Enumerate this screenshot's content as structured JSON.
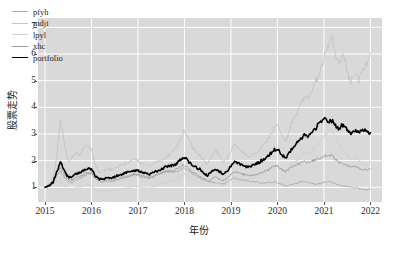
{
  "chart_data": {
    "type": "line",
    "title": "",
    "xlabel": "年份",
    "ylabel": "股票走势",
    "xlim": [
      2014.85,
      2022.25
    ],
    "ylim": [
      0.45,
      7.35
    ],
    "xticks": [
      "2015",
      "2016",
      "2017",
      "2018",
      "2019",
      "2020",
      "2021",
      "2022"
    ],
    "xtick_values": [
      2015,
      2016,
      2017,
      2018,
      2019,
      2020,
      2021,
      2022
    ],
    "yticks": [
      "1",
      "2",
      "3",
      "4",
      "5",
      "6",
      "7"
    ],
    "ytick_values": [
      1,
      2,
      3,
      4,
      5,
      6,
      7
    ],
    "grid": true,
    "grid_color": "#ffffff",
    "plot_bgcolor": "#d9d9d9",
    "figure_bgcolor": "#ffffff",
    "legend_position": "upper-left",
    "x": [
      2015.0,
      2015.08,
      2015.17,
      2015.25,
      2015.33,
      2015.42,
      2015.5,
      2015.58,
      2015.67,
      2015.75,
      2015.83,
      2015.92,
      2016.0,
      2016.08,
      2016.17,
      2016.25,
      2016.33,
      2016.42,
      2016.5,
      2016.58,
      2016.67,
      2016.75,
      2016.83,
      2016.92,
      2017.0,
      2017.08,
      2017.17,
      2017.25,
      2017.33,
      2017.42,
      2017.5,
      2017.58,
      2017.67,
      2017.75,
      2017.83,
      2017.92,
      2018.0,
      2018.08,
      2018.17,
      2018.25,
      2018.33,
      2018.42,
      2018.5,
      2018.58,
      2018.67,
      2018.75,
      2018.83,
      2018.92,
      2019.0,
      2019.08,
      2019.17,
      2019.25,
      2019.33,
      2019.42,
      2019.5,
      2019.58,
      2019.67,
      2019.75,
      2019.83,
      2019.92,
      2020.0,
      2020.08,
      2020.17,
      2020.25,
      2020.33,
      2020.42,
      2020.5,
      2020.58,
      2020.67,
      2020.75,
      2020.83,
      2020.92,
      2021.0,
      2021.08,
      2021.17,
      2021.25,
      2021.33,
      2021.42,
      2021.5,
      2021.58,
      2021.67,
      2021.75,
      2021.83,
      2021.92,
      2022.0
    ],
    "series": [
      {
        "name": "pfyh",
        "color": "#a8a8a8",
        "width": 0.9,
        "values": [
          1.0,
          1.05,
          1.12,
          1.45,
          1.62,
          1.38,
          1.2,
          1.18,
          1.3,
          1.35,
          1.42,
          1.5,
          1.55,
          1.4,
          1.3,
          1.28,
          1.32,
          1.3,
          1.33,
          1.36,
          1.4,
          1.42,
          1.45,
          1.5,
          1.48,
          1.45,
          1.42,
          1.4,
          1.44,
          1.5,
          1.55,
          1.6,
          1.58,
          1.55,
          1.6,
          1.68,
          1.72,
          1.65,
          1.5,
          1.42,
          1.35,
          1.28,
          1.22,
          1.2,
          1.18,
          1.15,
          1.12,
          1.18,
          1.3,
          1.35,
          1.32,
          1.28,
          1.25,
          1.22,
          1.2,
          1.18,
          1.16,
          1.15,
          1.18,
          1.2,
          1.18,
          1.12,
          1.05,
          1.08,
          1.12,
          1.15,
          1.2,
          1.22,
          1.18,
          1.15,
          1.12,
          1.15,
          1.2,
          1.22,
          1.18,
          1.12,
          1.08,
          1.05,
          1.02,
          1.0,
          0.98,
          0.95,
          0.92,
          0.9,
          0.92
        ]
      },
      {
        "name": "mdjt",
        "color": "#c4c4c4",
        "width": 0.9,
        "values": [
          1.0,
          1.1,
          1.35,
          2.1,
          3.55,
          2.6,
          1.95,
          2.1,
          2.35,
          2.2,
          2.45,
          2.6,
          2.4,
          1.85,
          1.55,
          1.6,
          1.72,
          1.65,
          1.7,
          1.78,
          1.85,
          1.9,
          1.95,
          2.05,
          2.0,
          1.92,
          1.85,
          1.8,
          1.88,
          1.95,
          2.0,
          2.1,
          2.2,
          2.35,
          2.5,
          2.8,
          3.15,
          2.85,
          2.5,
          2.35,
          2.2,
          2.0,
          1.85,
          2.15,
          2.45,
          2.2,
          1.95,
          2.1,
          2.35,
          2.6,
          2.45,
          2.3,
          2.2,
          2.15,
          2.25,
          2.35,
          2.5,
          2.65,
          2.9,
          3.2,
          3.35,
          3.0,
          2.7,
          3.1,
          3.5,
          3.8,
          4.1,
          4.4,
          4.3,
          4.6,
          5.0,
          5.4,
          5.8,
          6.2,
          6.7,
          5.9,
          5.5,
          6.0,
          5.4,
          4.9,
          5.3,
          5.0,
          5.45,
          5.7,
          6.05
        ]
      },
      {
        "name": "lpyl",
        "color": "#cfcfcf",
        "width": 0.9,
        "values": [
          1.0,
          1.02,
          1.08,
          1.25,
          1.18,
          1.05,
          0.95,
          0.92,
          0.98,
          1.02,
          1.05,
          1.1,
          1.08,
          0.95,
          0.85,
          0.82,
          0.85,
          0.88,
          0.9,
          0.92,
          0.95,
          0.98,
          1.0,
          1.05,
          1.02,
          1.0,
          0.98,
          0.96,
          1.0,
          1.05,
          1.1,
          1.15,
          1.2,
          1.25,
          1.3,
          1.4,
          1.5,
          1.42,
          1.3,
          1.25,
          1.2,
          1.12,
          1.05,
          1.08,
          1.15,
          1.1,
          1.05,
          1.15,
          1.3,
          1.38,
          1.35,
          1.3,
          1.28,
          1.3,
          1.35,
          1.42,
          1.5,
          1.58,
          1.68,
          1.8,
          1.85,
          1.7,
          1.6,
          1.75,
          1.9,
          2.0,
          2.15,
          2.3,
          2.25,
          2.4,
          2.55,
          2.7,
          2.9,
          3.05,
          3.2,
          2.85,
          2.6,
          2.4,
          2.2,
          2.05,
          2.15,
          2.0,
          1.9,
          1.82,
          1.95
        ]
      },
      {
        "name": "xhc",
        "color": "#9c9c9c",
        "width": 0.9,
        "values": [
          1.0,
          1.08,
          1.2,
          1.55,
          1.75,
          1.5,
          1.3,
          1.28,
          1.38,
          1.42,
          1.5,
          1.55,
          1.52,
          1.35,
          1.22,
          1.2,
          1.25,
          1.22,
          1.26,
          1.3,
          1.34,
          1.38,
          1.42,
          1.48,
          1.45,
          1.4,
          1.36,
          1.34,
          1.4,
          1.46,
          1.52,
          1.58,
          1.6,
          1.62,
          1.68,
          1.78,
          1.85,
          1.72,
          1.58,
          1.5,
          1.42,
          1.32,
          1.25,
          1.3,
          1.38,
          1.32,
          1.25,
          1.35,
          1.5,
          1.58,
          1.55,
          1.5,
          1.46,
          1.45,
          1.48,
          1.52,
          1.58,
          1.62,
          1.7,
          1.78,
          1.8,
          1.68,
          1.58,
          1.68,
          1.78,
          1.85,
          1.92,
          1.98,
          1.92,
          1.98,
          2.05,
          2.1,
          2.15,
          2.18,
          2.2,
          2.05,
          1.95,
          1.9,
          1.82,
          1.75,
          1.78,
          1.72,
          1.68,
          1.65,
          1.7
        ]
      },
      {
        "name": "portfolio",
        "color": "#000000",
        "width": 1.6,
        "values": [
          1.0,
          1.06,
          1.18,
          1.58,
          1.95,
          1.6,
          1.38,
          1.4,
          1.52,
          1.55,
          1.65,
          1.72,
          1.68,
          1.45,
          1.3,
          1.3,
          1.38,
          1.35,
          1.4,
          1.45,
          1.5,
          1.55,
          1.58,
          1.65,
          1.62,
          1.56,
          1.52,
          1.5,
          1.56,
          1.62,
          1.68,
          1.75,
          1.78,
          1.82,
          1.9,
          2.02,
          2.15,
          2.0,
          1.82,
          1.75,
          1.68,
          1.55,
          1.45,
          1.55,
          1.68,
          1.58,
          1.48,
          1.6,
          1.82,
          1.95,
          1.9,
          1.82,
          1.78,
          1.78,
          1.85,
          1.92,
          2.0,
          2.1,
          2.22,
          2.38,
          2.45,
          2.25,
          2.1,
          2.3,
          2.5,
          2.65,
          2.8,
          2.95,
          2.9,
          3.05,
          3.25,
          3.45,
          3.6,
          3.48,
          3.55,
          3.3,
          3.2,
          3.35,
          3.15,
          3.0,
          3.12,
          3.05,
          3.18,
          3.1,
          3.05
        ]
      }
    ]
  },
  "legend": {
    "items": [
      {
        "label": "pfyh"
      },
      {
        "label": "mdjt"
      },
      {
        "label": "lpyl"
      },
      {
        "label": "xhc"
      },
      {
        "label": "portfolio"
      }
    ]
  }
}
